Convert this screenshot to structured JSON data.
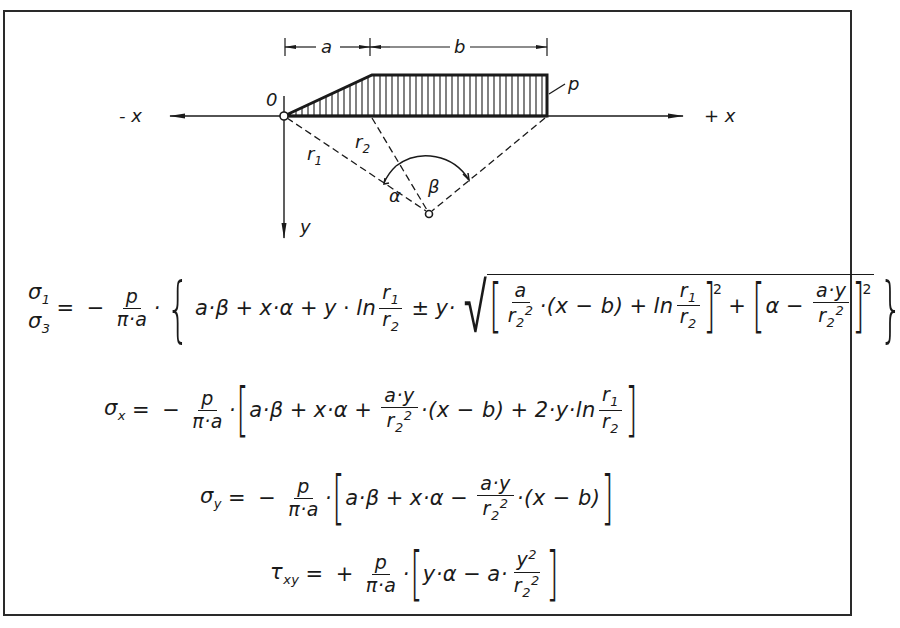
{
  "figure": {
    "diagram": {
      "axis_labels": {
        "neg_x": "- x",
        "pos_x": "+ x",
        "y": "y",
        "origin": "0"
      },
      "dimensions": {
        "a": "a",
        "b": "b"
      },
      "load_label": "p",
      "radius_labels": {
        "r1": "r",
        "r1_sub": "1",
        "r2": "r",
        "r2_sub": "2"
      },
      "angle_labels": {
        "alpha": "α",
        "beta": "β"
      }
    },
    "equations": [
      {
        "id": "sigma13",
        "lhs_top": "σ₁",
        "lhs_bottom": "σ₃",
        "text": "σ1,σ3 = − p/(π·a) · { a·β + x·α + y · ln(r1/r2) ± y · √( [ a/r2² ·(x−b) + ln(r1/r2) ]² + [ α − a·y/r2² ]² ) }"
      },
      {
        "id": "sigma_x",
        "lhs": "σx",
        "text": "σx = − p/(π·a) · [ a·β + x·α + a·y/r2² ·(x−b) + 2·y·ln(r1/r2) ]"
      },
      {
        "id": "sigma_y",
        "lhs": "σy",
        "text": "σy = − p/(π·a) · [ a·β + x·α − a·y/r2² ·(x−b) ]"
      },
      {
        "id": "tau_xy",
        "lhs": "τxy",
        "text": "τxy = + p/(π·a) · [ y·α − a· y²/r2² ]"
      }
    ],
    "tokens": {
      "sigma": "σ",
      "tau": "τ",
      "eq": "=",
      "minus": "−",
      "plus": "+",
      "pm": "±",
      "p": "p",
      "pi_a": "π·a",
      "dot": "·",
      "a_beta": "a·β",
      "x_alpha": "x·α",
      "y": "y",
      "ln": "ln",
      "r": "r",
      "one": "1",
      "two": "2",
      "three": "3",
      "a": "a",
      "x_minus_b": "(x − b)",
      "ay": "a·y",
      "alpha": "α",
      "two_y_ln": "2·y·ln",
      "y_alpha": "y·α",
      "a_dot": "a·",
      "x": "x",
      "xy": "xy"
    }
  }
}
